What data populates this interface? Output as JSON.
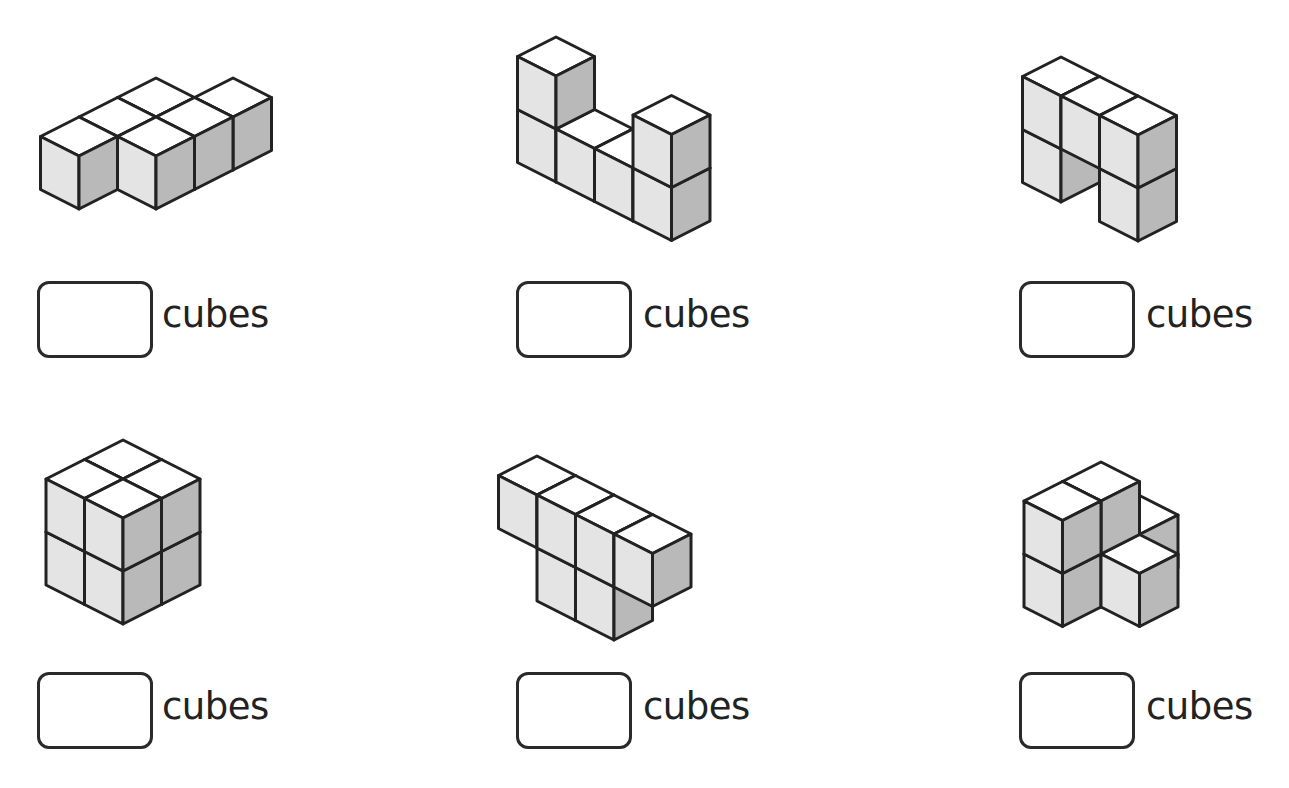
{
  "worksheet": {
    "unit_label": "cubes",
    "colors": {
      "top": "#ffffff",
      "left": "#e4e4e4",
      "right": "#b9b9b9",
      "edge": "#222222"
    },
    "cube_geometry": {
      "dx": 38.5,
      "dy": 19.5,
      "height": 53,
      "stroke_width": 3
    },
    "problems": [
      {
        "id": 1,
        "origin": [
          79,
          170
        ],
        "cubes": [
          [
            0,
            0,
            0
          ],
          [
            0,
            -1,
            0
          ],
          [
            0,
            -2,
            0
          ],
          [
            1,
            -1,
            0
          ],
          [
            1,
            -2,
            0
          ],
          [
            1,
            -3,
            0
          ]
        ],
        "answer_box": {
          "x": 37,
          "y": 281,
          "value": ""
        },
        "label_pos": [
          162,
          296
        ]
      },
      {
        "id": 2,
        "origin": [
          556,
          143
        ],
        "cubes": [
          [
            0,
            0,
            0
          ],
          [
            0,
            0,
            1
          ],
          [
            1,
            0,
            0
          ],
          [
            2,
            0,
            0
          ],
          [
            3,
            0,
            0
          ],
          [
            3,
            0,
            1
          ]
        ],
        "answer_box": {
          "x": 516,
          "y": 281,
          "value": ""
        },
        "label_pos": [
          643,
          296
        ]
      },
      {
        "id": 3,
        "origin": [
          1061,
          163
        ],
        "cubes": [
          [
            0,
            0,
            0
          ],
          [
            0,
            0,
            1
          ],
          [
            1,
            0,
            1
          ],
          [
            2,
            0,
            0
          ],
          [
            2,
            0,
            1
          ]
        ],
        "answer_box": {
          "x": 1019,
          "y": 281,
          "value": ""
        },
        "label_pos": [
          1146,
          296
        ]
      },
      {
        "id": 4,
        "origin": [
          123,
          546
        ],
        "cubes": [
          [
            0,
            0,
            0
          ],
          [
            1,
            0,
            0
          ],
          [
            0,
            1,
            0
          ],
          [
            1,
            1,
            0
          ],
          [
            0,
            0,
            1
          ],
          [
            1,
            0,
            1
          ],
          [
            0,
            1,
            1
          ],
          [
            1,
            1,
            1
          ]
        ],
        "answer_box": {
          "x": 37,
          "y": 672,
          "value": ""
        },
        "label_pos": [
          162,
          688
        ]
      },
      {
        "id": 5,
        "origin": [
          537,
          562
        ],
        "cubes": [
          [
            0,
            0,
            1
          ],
          [
            1,
            0,
            1
          ],
          [
            2,
            0,
            1
          ],
          [
            3,
            0,
            1
          ],
          [
            1,
            0,
            0
          ],
          [
            2,
            0,
            0
          ]
        ],
        "answer_box": {
          "x": 516,
          "y": 672,
          "value": ""
        },
        "label_pos": [
          643,
          688
        ]
      },
      {
        "id": 6,
        "origin": [
          1101,
          568
        ],
        "cubes": [
          [
            0,
            -1,
            0
          ],
          [
            0,
            0,
            0
          ],
          [
            0,
            1,
            0
          ],
          [
            1,
            0,
            0
          ],
          [
            0,
            0,
            1
          ],
          [
            0,
            1,
            1
          ]
        ],
        "answer_box": {
          "x": 1019,
          "y": 672,
          "value": ""
        },
        "label_pos": [
          1146,
          688
        ]
      }
    ]
  }
}
